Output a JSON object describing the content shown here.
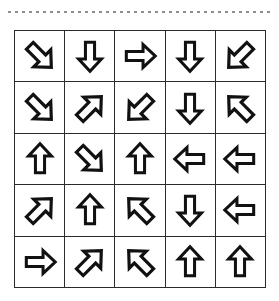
{
  "page": {
    "background_color": "#ffffff",
    "ink_color": "#111111",
    "rule_color": "#8e8e8e",
    "grid_line_color": "#2b2b2b"
  },
  "header": {
    "clipped_text": "· · · · · · · ·",
    "dotted_rule_label": "dotted-separator"
  },
  "grid": {
    "rows": 5,
    "columns": 5,
    "cell_count": 25,
    "legend": {
      "n": "up",
      "ne": "up-right",
      "e": "right",
      "se": "down-right",
      "s": "down",
      "sw": "down-left",
      "w": "left",
      "nw": "up-left"
    },
    "cells": [
      {
        "row": 1,
        "col": 1,
        "direction": "se",
        "label": "down-right-arrow"
      },
      {
        "row": 1,
        "col": 2,
        "direction": "s",
        "label": "down-arrow"
      },
      {
        "row": 1,
        "col": 3,
        "direction": "e",
        "label": "right-arrow"
      },
      {
        "row": 1,
        "col": 4,
        "direction": "s",
        "label": "down-arrow"
      },
      {
        "row": 1,
        "col": 5,
        "direction": "sw",
        "label": "down-left-arrow"
      },
      {
        "row": 2,
        "col": 1,
        "direction": "se",
        "label": "down-right-arrow"
      },
      {
        "row": 2,
        "col": 2,
        "direction": "ne",
        "label": "up-right-arrow"
      },
      {
        "row": 2,
        "col": 3,
        "direction": "sw",
        "label": "down-left-arrow"
      },
      {
        "row": 2,
        "col": 4,
        "direction": "s",
        "label": "down-arrow"
      },
      {
        "row": 2,
        "col": 5,
        "direction": "nw",
        "label": "up-left-arrow"
      },
      {
        "row": 3,
        "col": 1,
        "direction": "n",
        "label": "up-arrow"
      },
      {
        "row": 3,
        "col": 2,
        "direction": "se",
        "label": "down-right-arrow"
      },
      {
        "row": 3,
        "col": 3,
        "direction": "n",
        "label": "up-arrow"
      },
      {
        "row": 3,
        "col": 4,
        "direction": "w",
        "label": "left-arrow"
      },
      {
        "row": 3,
        "col": 5,
        "direction": "w",
        "label": "left-arrow"
      },
      {
        "row": 4,
        "col": 1,
        "direction": "ne",
        "label": "up-right-arrow"
      },
      {
        "row": 4,
        "col": 2,
        "direction": "n",
        "label": "up-arrow"
      },
      {
        "row": 4,
        "col": 3,
        "direction": "nw",
        "label": "up-left-arrow"
      },
      {
        "row": 4,
        "col": 4,
        "direction": "s",
        "label": "down-arrow"
      },
      {
        "row": 4,
        "col": 5,
        "direction": "w",
        "label": "left-arrow"
      },
      {
        "row": 5,
        "col": 1,
        "direction": "e",
        "label": "right-arrow"
      },
      {
        "row": 5,
        "col": 2,
        "direction": "ne",
        "label": "up-right-arrow"
      },
      {
        "row": 5,
        "col": 3,
        "direction": "nw",
        "label": "up-left-arrow"
      },
      {
        "row": 5,
        "col": 4,
        "direction": "n",
        "label": "up-arrow"
      },
      {
        "row": 5,
        "col": 5,
        "direction": "n",
        "label": "up-arrow"
      }
    ]
  }
}
